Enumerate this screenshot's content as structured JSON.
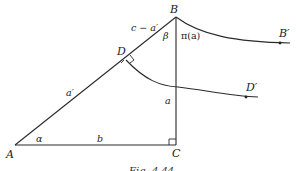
{
  "figure": {
    "caption": "Fig. 4.44",
    "points": {
      "A": {
        "label": "A",
        "x": 15,
        "y": 145
      },
      "B": {
        "label": "B",
        "x": 176,
        "y": 17
      },
      "C": {
        "label": "C",
        "x": 176,
        "y": 145
      },
      "D": {
        "label": "D",
        "x": 126,
        "y": 58
      },
      "B_prime": {
        "label": "B′",
        "x": 280,
        "y": 43
      },
      "D_prime": {
        "label": "D′",
        "x": 246,
        "y": 96
      }
    },
    "segment_labels": {
      "c_minus_a_prime": "c − a′",
      "a_prime": "a′",
      "a": "a",
      "b": "b"
    },
    "angle_labels": {
      "alpha": "α",
      "beta": "β",
      "pi_a": "π(a)"
    },
    "right_angles": [
      "C",
      "D"
    ],
    "curves": [
      {
        "from": "B",
        "to": "B_prime",
        "type": "parallel-ray"
      },
      {
        "from": "D",
        "to": "D_prime",
        "type": "parallel-ray"
      }
    ]
  }
}
